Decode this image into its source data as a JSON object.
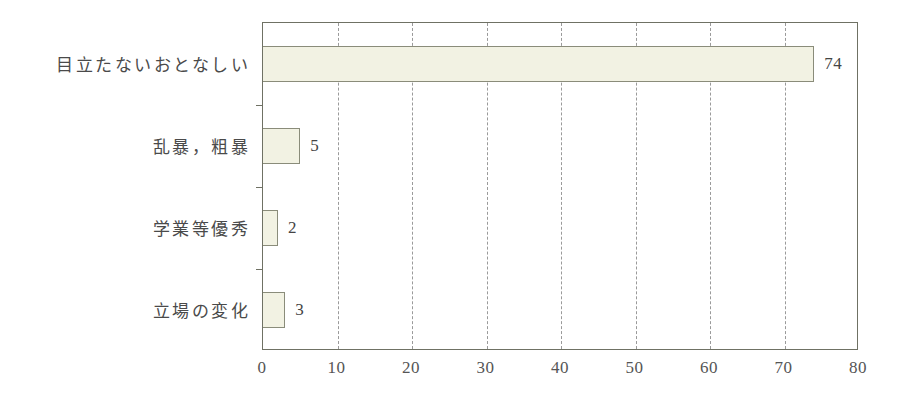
{
  "chart_data": {
    "type": "bar",
    "orientation": "horizontal",
    "title": "",
    "subtitle": "",
    "xlabel": "",
    "ylabel": "",
    "categories": [
      "目立たないおとなしい",
      "乱暴，粗暴",
      "学業等優秀",
      "立場の変化"
    ],
    "values": [
      74,
      5,
      2,
      3
    ],
    "value_labels": [
      "74",
      "5",
      "2",
      "3"
    ],
    "xlim": [
      0,
      80
    ],
    "xticks": [
      0,
      10,
      20,
      30,
      40,
      50,
      60,
      70,
      80
    ],
    "xtick_labels": [
      "0",
      "10",
      "20",
      "30",
      "40",
      "50",
      "60",
      "70",
      "80"
    ],
    "gridlines": {
      "vertical": [
        10,
        20,
        30,
        40,
        50,
        60,
        70
      ],
      "style": "dashed",
      "horizontal": []
    },
    "legend": {
      "visible": false,
      "entries": []
    },
    "colors": {
      "bar_fill": "#f2f2e3",
      "bar_border": "#8a8c7a",
      "frame": "#6f7164",
      "grid": "#9a9a9a",
      "text": "#4a4a4a",
      "background": "#ffffff"
    }
  }
}
